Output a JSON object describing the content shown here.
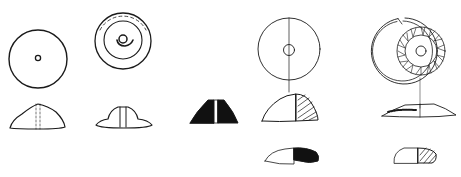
{
  "figure": {
    "ink_color": "#1a1a1a",
    "background": "#ffffff",
    "objects": [
      {
        "id": "whorl-1",
        "views": [
          "plan",
          "section"
        ]
      },
      {
        "id": "whorl-2",
        "views": [
          "plan",
          "section"
        ]
      },
      {
        "id": "whorl-3",
        "views": [
          "section"
        ]
      },
      {
        "id": "whorl-4",
        "views": [
          "plan",
          "section",
          "section-alt"
        ]
      },
      {
        "id": "whorl-5",
        "views": [
          "plan-decorated",
          "section",
          "section-alt"
        ]
      }
    ]
  }
}
